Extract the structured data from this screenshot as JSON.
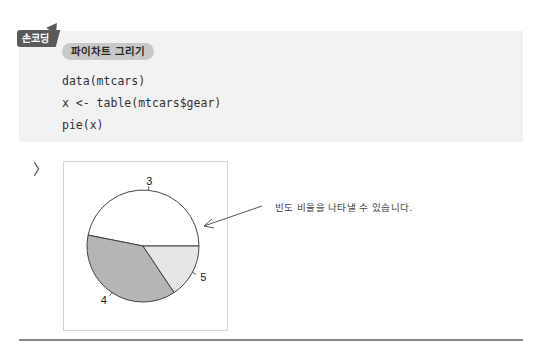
{
  "badge": {
    "label": "손코딩"
  },
  "code_block": {
    "title": "파이차트 그리기",
    "lines": [
      "data(mtcars)",
      "x <- table(mtcars$gear)",
      "pie(x)"
    ]
  },
  "output": {
    "prompt_icon": "chevron-right-icon",
    "prompt_glyph": "〉"
  },
  "annotation": {
    "text": "빈도 비율을 나타낼 수 있습니다."
  },
  "chart_data": {
    "type": "pie",
    "title": "",
    "categories": [
      "3",
      "4",
      "5"
    ],
    "values": [
      15,
      12,
      5
    ],
    "colors": [
      "#ffffff",
      "#b5b5b5",
      "#e6e6e6"
    ],
    "start_angle_deg": 0,
    "direction": "counterclockwise",
    "labels": [
      "3",
      "4",
      "5"
    ]
  }
}
